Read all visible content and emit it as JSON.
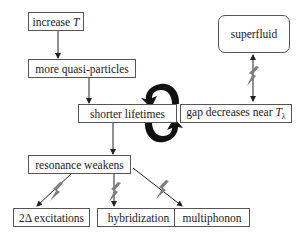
{
  "diagram": {
    "type": "flowchart",
    "nodes": [
      {
        "id": "increase_t",
        "label_prefix": "increase ",
        "label_italic": "T"
      },
      {
        "id": "more_qp",
        "label": "more quasi-particles"
      },
      {
        "id": "shorter_lifetimes",
        "label": "shorter lifetimes"
      },
      {
        "id": "superfluid",
        "label": "superfluid"
      },
      {
        "id": "gap_decreases",
        "label_prefix": "gap decreases near ",
        "label_italic": "T",
        "label_sub": "λ"
      },
      {
        "id": "resonance_weakens",
        "label": "resonance weakens"
      },
      {
        "id": "two_delta",
        "label": "2Δ excitations"
      },
      {
        "id": "hybridization",
        "label": "hybridization"
      },
      {
        "id": "multiphonon",
        "label": "multiphonon"
      }
    ],
    "edges": [
      {
        "from": "increase_t",
        "to": "more_qp",
        "style": "arrow"
      },
      {
        "from": "more_qp",
        "to": "shorter_lifetimes",
        "style": "arrow"
      },
      {
        "from": "shorter_lifetimes",
        "to": "gap_decreases",
        "style": "cyclic-feedback"
      },
      {
        "from": "superfluid",
        "to": "gap_decreases",
        "style": "double-arrow-with-lightning"
      },
      {
        "from": "shorter_lifetimes",
        "to": "resonance_weakens",
        "style": "arrow"
      },
      {
        "from": "resonance_weakens",
        "to": "two_delta",
        "style": "arrow-with-lightning"
      },
      {
        "from": "resonance_weakens",
        "to": "hybridization",
        "style": "arrow-with-lightning"
      },
      {
        "from": "resonance_weakens",
        "to": "multiphonon",
        "style": "arrow-with-lightning"
      }
    ],
    "colors": {
      "box_border": "#555555",
      "arrow": "#222222",
      "cycle_arrow": "#111111",
      "lightning": "#808080"
    }
  }
}
